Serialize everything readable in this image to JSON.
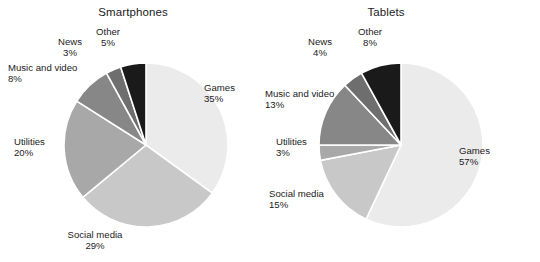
{
  "figure": {
    "background": "#ffffff",
    "text_color": "#1b1b1b",
    "separator_color": "#ffffff"
  },
  "palette": {
    "games": "#ebebeb",
    "social_media": "#c8c8c8",
    "utilities": "#a8a8a8",
    "music_and_video": "#878787",
    "news": "#6e6e6e",
    "other": "#1a1a1a"
  },
  "panels": [
    {
      "title": "Smartphones",
      "labels": [
        {
          "name": "Games",
          "pct": "35%"
        },
        {
          "name": "Social media",
          "pct": "29%"
        },
        {
          "name": "Utilities",
          "pct": "20%"
        },
        {
          "name": "Music and video",
          "pct": "8%"
        },
        {
          "name": "News",
          "pct": "3%"
        },
        {
          "name": "Other",
          "pct": "5%"
        }
      ]
    },
    {
      "title": "Tablets",
      "labels": [
        {
          "name": "Games",
          "pct": "57%"
        },
        {
          "name": "Social media",
          "pct": "15%"
        },
        {
          "name": "Utilities",
          "pct": "3%"
        },
        {
          "name": "Music and video",
          "pct": "13%"
        },
        {
          "name": "News",
          "pct": "4%"
        },
        {
          "name": "Other",
          "pct": "8%"
        }
      ]
    }
  ],
  "chart_data": [
    {
      "type": "pie",
      "title": "Smartphones",
      "categories": [
        "Games",
        "Social media",
        "Utilities",
        "Music and video",
        "News",
        "Other"
      ],
      "values": [
        35,
        29,
        20,
        8,
        3,
        5
      ],
      "unit": "percent",
      "total": 100,
      "start_angle_deg": 0,
      "direction": "clockwise",
      "labels_position": "outside",
      "legend": "none",
      "grid": false,
      "colors": [
        "#ebebeb",
        "#c8c8c8",
        "#a8a8a8",
        "#878787",
        "#6e6e6e",
        "#1a1a1a"
      ]
    },
    {
      "type": "pie",
      "title": "Tablets",
      "categories": [
        "Games",
        "Social media",
        "Utilities",
        "Music and video",
        "News",
        "Other"
      ],
      "values": [
        57,
        15,
        3,
        13,
        4,
        8
      ],
      "unit": "percent",
      "total": 100,
      "start_angle_deg": 0,
      "direction": "clockwise",
      "labels_position": "outside",
      "legend": "none",
      "grid": false,
      "colors": [
        "#ebebeb",
        "#c8c8c8",
        "#a8a8a8",
        "#878787",
        "#6e6e6e",
        "#1a1a1a"
      ]
    }
  ]
}
